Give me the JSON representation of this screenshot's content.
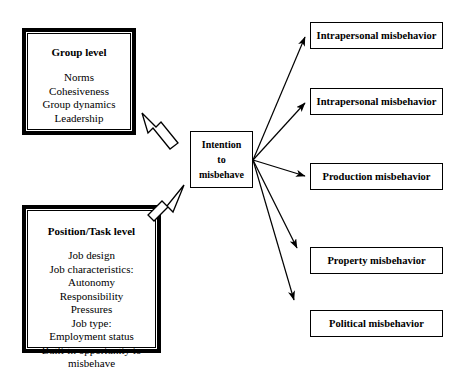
{
  "diagram": {
    "colors": {
      "stroke": "#000000",
      "fill": "#ffffff",
      "background": "#ffffff"
    },
    "antecedents": [
      {
        "id": "group-level",
        "title": "Group level",
        "items": [
          "Norms",
          "Cohesiveness",
          "Group dynamics",
          "Leadership"
        ]
      },
      {
        "id": "position-task-level",
        "title": "Position/Task level",
        "items": [
          "Job design",
          "Job characteristics:",
          "Autonomy",
          "Responsibility",
          "Pressures",
          "Job type:",
          "Employment status",
          "Built-in opportunity to",
          "misbehave"
        ]
      }
    ],
    "center": {
      "id": "intention-to-misbehave",
      "lines": [
        "Intention",
        "to",
        "misbehave"
      ]
    },
    "outcomes": [
      {
        "id": "outcome-1",
        "label": "Intrapersonal misbehavior",
        "top": 22
      },
      {
        "id": "outcome-2",
        "label": "Intrapersonal misbehavior",
        "top": 88
      },
      {
        "id": "outcome-3",
        "label": "Production misbehavior",
        "top": 163
      },
      {
        "id": "outcome-4",
        "label": "Property misbehavior",
        "top": 247
      },
      {
        "id": "outcome-5",
        "label": "Political misbehavior",
        "top": 310
      }
    ],
    "connectors": {
      "block_arrows": [
        {
          "id": "group-to-intention",
          "direction": "down-right"
        },
        {
          "id": "position-to-intention",
          "direction": "up-right"
        }
      ],
      "fan_origin": {
        "x": 253,
        "y": 160
      },
      "fan_arrow_count": 5
    }
  }
}
